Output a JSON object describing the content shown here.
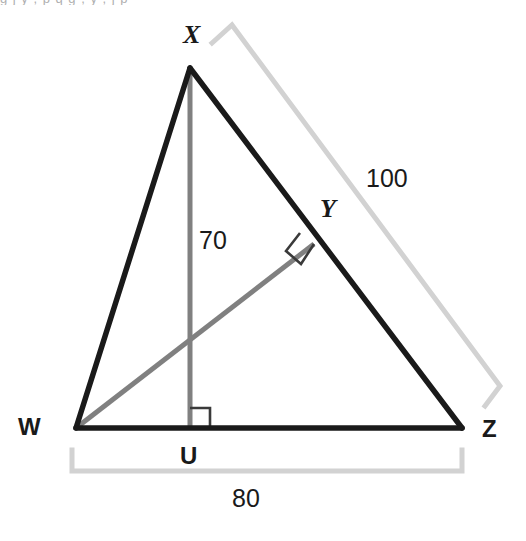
{
  "figure": {
    "kind": "geometry-diagram",
    "canvas": {
      "width": 526,
      "height": 541
    },
    "colors": {
      "outline": "#1a1a1a",
      "cevian": "#808080",
      "bracket": "#d2d2d2",
      "label": "#1a1a1a",
      "background": "#ffffff"
    },
    "top_clipped_text": "g   j   y   ,   p   q   g   ,   y   ,   j   p",
    "vertices": [
      {
        "id": "X",
        "label": "X",
        "x": 190,
        "y": 68,
        "label_x": 183,
        "label_y": 22,
        "style": "italic"
      },
      {
        "id": "W",
        "label": "W",
        "x": 76,
        "y": 428,
        "label_x": 18,
        "label_y": 415,
        "style": "upright"
      },
      {
        "id": "Z",
        "label": "Z",
        "x": 462,
        "y": 428,
        "label_x": 482,
        "label_y": 417,
        "style": "upright"
      },
      {
        "id": "U",
        "label": "U",
        "x": 190,
        "y": 428,
        "label_x": 180,
        "label_y": 444,
        "style": "upright"
      },
      {
        "id": "Y",
        "label": "Y",
        "x": 314,
        "y": 244,
        "label_x": 320,
        "label_y": 196,
        "style": "italic"
      }
    ],
    "segments": [
      {
        "id": "WX",
        "from": "W",
        "to": "X",
        "color": "#1a1a1a",
        "width": 5
      },
      {
        "id": "XZ",
        "from": "X",
        "to": "Z",
        "color": "#1a1a1a",
        "width": 5
      },
      {
        "id": "WZ",
        "from": "W",
        "to": "Z",
        "color": "#1a1a1a",
        "width": 5
      },
      {
        "id": "XU",
        "from": "X",
        "to": "U",
        "color": "#808080",
        "width": 5
      },
      {
        "id": "WY",
        "from": "W",
        "to": "Y",
        "color": "#808080",
        "width": 5
      }
    ],
    "right_angles": [
      {
        "id": "right-angle-at-U",
        "at": "U",
        "size": 18,
        "orientation": "axis-aligned"
      },
      {
        "id": "right-angle-at-Y",
        "at": "Y",
        "size": 18,
        "orientation": "rotated"
      }
    ],
    "measures": [
      {
        "id": "measure-XZ",
        "value": "100",
        "label_x": 366,
        "label_y": 166,
        "bracket": "outer-right",
        "describes": "XZ"
      },
      {
        "id": "measure-XU",
        "value": "70",
        "label_x": 199,
        "label_y": 228,
        "bracket": "none",
        "describes": "XU"
      },
      {
        "id": "measure-WZ",
        "value": "80",
        "label_x": 232,
        "label_y": 486,
        "bracket": "bottom",
        "describes": "WZ"
      }
    ]
  }
}
